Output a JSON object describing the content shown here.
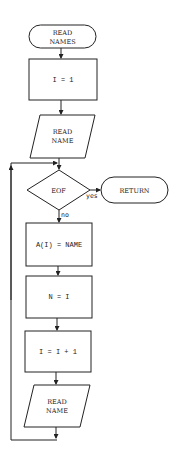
{
  "flowchart": {
    "start": {
      "line1": "READ",
      "line2": "NAMES"
    },
    "init": {
      "text": "I = 1"
    },
    "read1": {
      "line1": "READ",
      "line2": "NAME"
    },
    "decision": {
      "text": "EOF",
      "yes_label": "yes",
      "no_label": "no"
    },
    "return": {
      "text": "RETURN"
    },
    "assign": {
      "text": "A(I) = NAME"
    },
    "setn": {
      "text": "N = I"
    },
    "increment": {
      "text": "I = I + 1"
    },
    "read2": {
      "line1": "READ",
      "line2": "NAME"
    }
  },
  "colors": {
    "stroke": "#222222",
    "background": "#ffffff"
  }
}
